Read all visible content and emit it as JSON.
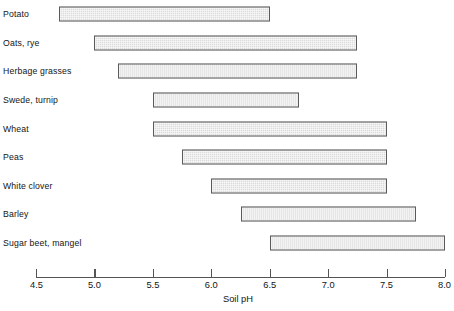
{
  "chart_data": {
    "type": "bar",
    "orientation": "horizontal",
    "subtype": "range-bar",
    "title": "",
    "xlabel": "Soil pH",
    "ylabel": "",
    "xlim": [
      4.5,
      8.0
    ],
    "ylim": null,
    "grid": false,
    "legend": null,
    "xticks": [
      "4.5",
      "5.0",
      "5.5",
      "6.0",
      "6.5",
      "7.0",
      "7.5",
      "8.0"
    ],
    "xtick_values": [
      4.5,
      5.0,
      5.5,
      6.0,
      6.5,
      7.0,
      7.5,
      8.0
    ],
    "categories": [
      "Potato",
      "Oats, rye",
      "Herbage grasses",
      "Swede, turnip",
      "Wheat",
      "Peas",
      "White clover",
      "Barley",
      "Sugar beet, mangel"
    ],
    "ranges": [
      {
        "label": "Potato",
        "start": 4.7,
        "end": 6.5
      },
      {
        "label": "Oats, rye",
        "start": 5.0,
        "end": 7.25
      },
      {
        "label": "Herbage grasses",
        "start": 5.2,
        "end": 7.25
      },
      {
        "label": "Swede, turnip",
        "start": 5.5,
        "end": 6.75
      },
      {
        "label": "Wheat",
        "start": 5.5,
        "end": 7.5
      },
      {
        "label": "Peas",
        "start": 5.75,
        "end": 7.5
      },
      {
        "label": "White clover",
        "start": 6.0,
        "end": 7.5
      },
      {
        "label": "Barley",
        "start": 6.25,
        "end": 7.75
      },
      {
        "label": "Sugar beet, mangel",
        "start": 6.5,
        "end": 8.0
      }
    ],
    "colors": {
      "bar_fill": "#dcdcdc",
      "bar_border": "#5a5a5a",
      "axis": "#555555",
      "text": "#141414",
      "background": "#ffffff"
    }
  }
}
